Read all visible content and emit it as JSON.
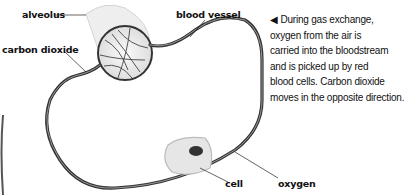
{
  "labels": {
    "alveolus": "alveolus",
    "carbon_dioxide": "carbon dioxide",
    "blood_vessel": "blood vessel",
    "cell": "cell",
    "oxygen": "oxygen"
  },
  "caption": {
    "arrow": "◀",
    "lines": [
      "During gas exchange,",
      "oxygen from the air is",
      "carried into the bloodstream",
      "and is picked up by red",
      "blood cells. Carbon dioxide",
      "moves in the opposite direction."
    ]
  }
}
